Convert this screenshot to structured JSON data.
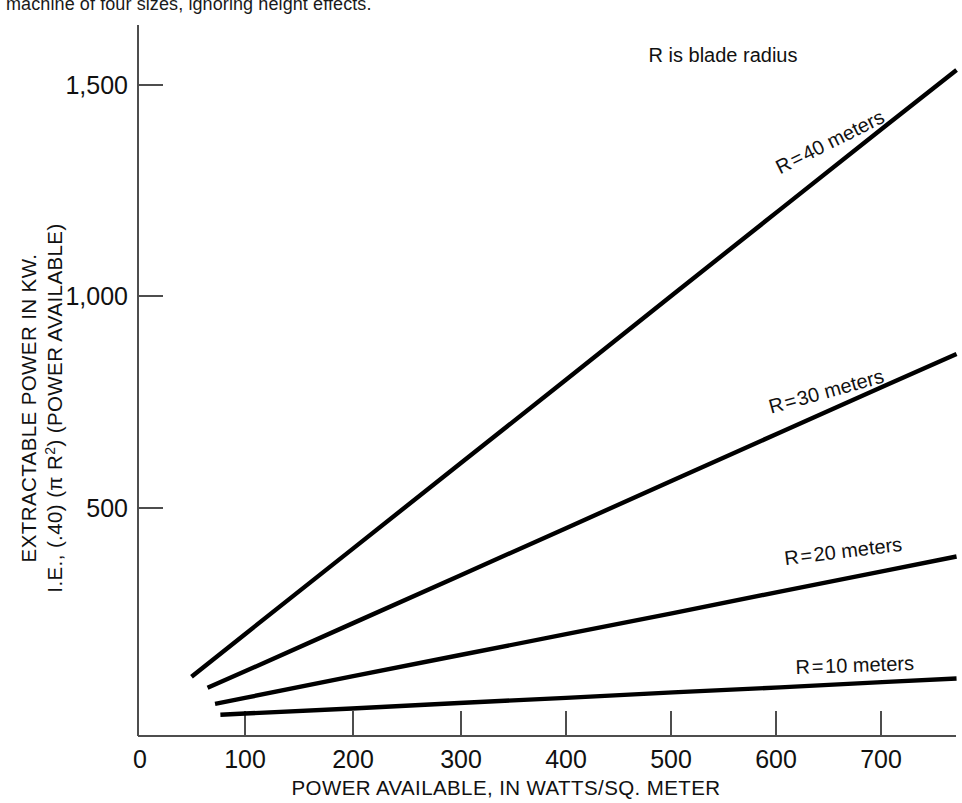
{
  "figure": {
    "caption_fragment": "machine of four sizes, ignoring height effects.",
    "annotation": "R is blade radius"
  },
  "axes": {
    "x_title": "POWER AVAILABLE, IN WATTS/SQ. METER",
    "y_title_line1": "EXTRACTABLE POWER IN KW.",
    "y_title_line2_a": "I.E., (.40) (",
    "y_title_line2_pi": "π R",
    "y_title_line2_sup": "2",
    "y_title_line2_b": ") (POWER AVAILABLE)",
    "x_ticks": [
      "0",
      "100",
      "200",
      "300",
      "400",
      "500",
      "600",
      "700"
    ],
    "y_ticks": [
      "500",
      "1,000",
      "1,500"
    ]
  },
  "series_labels": {
    "r40": "R = 40 meters",
    "r30": "R = 30 meters",
    "r20": "R = 20 meters",
    "r10": "R = 10 meters"
  },
  "colors": {
    "line": "#000000",
    "axis": "#4d4d4d",
    "text": "#111111",
    "background": "#ffffff"
  },
  "chart_data": {
    "type": "line",
    "title": "",
    "subtitle": "",
    "xlabel": "POWER AVAILABLE, IN WATTS/SQ. METER",
    "ylabel": "EXTRACTABLE POWER IN KW. I.E., (.40) (π R²) (POWER AVAILABLE)",
    "xlim": [
      0,
      770
    ],
    "ylim": [
      0,
      1560
    ],
    "x_ticks": [
      0,
      100,
      200,
      300,
      400,
      500,
      600,
      700
    ],
    "y_ticks": [
      500,
      1000,
      1500
    ],
    "grid": false,
    "legend": "inline-labels",
    "annotations": [
      {
        "text": "R is blade radius",
        "x": 565,
        "y": 1500
      }
    ],
    "series": [
      {
        "name": "R = 40 meters",
        "radius_m": 40,
        "swept_area_factor_kw_per_wm2": 2.011,
        "x": [
          50,
          765
        ],
        "values": [
          100,
          1538
        ],
        "points": [
          {
            "x": 50,
            "y": 100
          },
          {
            "x": 100,
            "y": 201
          },
          {
            "x": 200,
            "y": 402
          },
          {
            "x": 300,
            "y": 603
          },
          {
            "x": 400,
            "y": 804
          },
          {
            "x": 500,
            "y": 1006
          },
          {
            "x": 600,
            "y": 1207
          },
          {
            "x": 700,
            "y": 1408
          },
          {
            "x": 765,
            "y": 1538
          }
        ]
      },
      {
        "name": "R = 30 meters",
        "radius_m": 30,
        "swept_area_factor_kw_per_wm2": 1.131,
        "x": [
          65,
          765
        ],
        "values": [
          74,
          865
        ],
        "points": [
          {
            "x": 65,
            "y": 74
          },
          {
            "x": 100,
            "y": 113
          },
          {
            "x": 200,
            "y": 226
          },
          {
            "x": 300,
            "y": 339
          },
          {
            "x": 400,
            "y": 452
          },
          {
            "x": 500,
            "y": 566
          },
          {
            "x": 600,
            "y": 679
          },
          {
            "x": 700,
            "y": 792
          },
          {
            "x": 765,
            "y": 865
          }
        ]
      },
      {
        "name": "R = 20 meters",
        "radius_m": 20,
        "swept_area_factor_kw_per_wm2": 0.503,
        "x": [
          72,
          765
        ],
        "values": [
          36,
          385
        ],
        "points": [
          {
            "x": 72,
            "y": 36
          },
          {
            "x": 100,
            "y": 50
          },
          {
            "x": 200,
            "y": 101
          },
          {
            "x": 300,
            "y": 151
          },
          {
            "x": 400,
            "y": 201
          },
          {
            "x": 500,
            "y": 251
          },
          {
            "x": 600,
            "y": 302
          },
          {
            "x": 700,
            "y": 352
          },
          {
            "x": 765,
            "y": 385
          }
        ]
      },
      {
        "name": "R = 10 meters",
        "radius_m": 10,
        "swept_area_factor_kw_per_wm2": 0.126,
        "x": [
          77,
          765
        ],
        "values": [
          10,
          96
        ],
        "points": [
          {
            "x": 77,
            "y": 10
          },
          {
            "x": 100,
            "y": 13
          },
          {
            "x": 200,
            "y": 25
          },
          {
            "x": 300,
            "y": 38
          },
          {
            "x": 400,
            "y": 50
          },
          {
            "x": 500,
            "y": 63
          },
          {
            "x": 600,
            "y": 75
          },
          {
            "x": 700,
            "y": 88
          },
          {
            "x": 765,
            "y": 96
          }
        ]
      }
    ]
  }
}
